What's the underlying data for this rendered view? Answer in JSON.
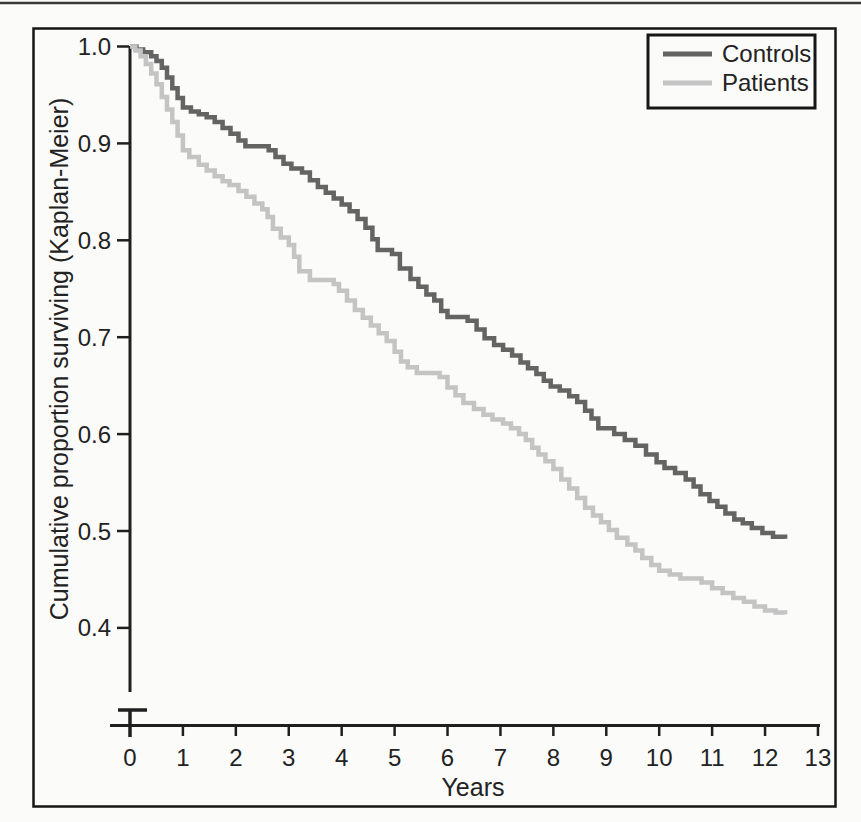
{
  "figure": {
    "y_axis_title": "Cumulative proportion surviving (Kaplan-Meier)",
    "x_axis_title": "Years"
  },
  "chart_data": {
    "type": "line",
    "variant": "kaplan-meier-step-curves",
    "title": "",
    "xlabel": "Years",
    "ylabel": "Cumulative proportion surviving (Kaplan-Meier)",
    "xlim": [
      0,
      13
    ],
    "ylim_displayed": [
      0.4,
      1.0
    ],
    "y_axis_break_at_bottom": true,
    "grid": false,
    "legend_position": "top-right",
    "x_ticks": [
      0,
      1,
      2,
      3,
      4,
      5,
      6,
      7,
      8,
      9,
      10,
      11,
      12,
      13
    ],
    "y_ticks": [
      1.0,
      0.9,
      0.8,
      0.7,
      0.6,
      0.5,
      0.4
    ],
    "y_tick_labels": [
      "1.0",
      "0.9",
      "0.8",
      "0.7",
      "0.6",
      "0.5",
      "0.4"
    ],
    "colors": {
      "controls": "#646464",
      "patients": "#c4c4c4",
      "axis": "#1f1f1f"
    },
    "series": [
      {
        "name": "Controls",
        "color": "#646464",
        "points": [
          [
            0,
            1.0
          ],
          [
            0.12,
            0.997
          ],
          [
            0.25,
            0.994
          ],
          [
            0.4,
            0.99
          ],
          [
            0.5,
            0.985
          ],
          [
            0.6,
            0.978
          ],
          [
            0.7,
            0.968
          ],
          [
            0.8,
            0.957
          ],
          [
            0.9,
            0.947
          ],
          [
            1.0,
            0.937
          ],
          [
            1.15,
            0.933
          ],
          [
            1.3,
            0.93
          ],
          [
            1.45,
            0.927
          ],
          [
            1.6,
            0.922
          ],
          [
            1.75,
            0.916
          ],
          [
            1.9,
            0.91
          ],
          [
            2.05,
            0.903
          ],
          [
            2.18,
            0.897
          ],
          [
            2.62,
            0.893
          ],
          [
            2.75,
            0.886
          ],
          [
            2.9,
            0.879
          ],
          [
            3.05,
            0.874
          ],
          [
            3.25,
            0.87
          ],
          [
            3.4,
            0.862
          ],
          [
            3.55,
            0.855
          ],
          [
            3.7,
            0.849
          ],
          [
            3.85,
            0.843
          ],
          [
            4.0,
            0.837
          ],
          [
            4.15,
            0.83
          ],
          [
            4.3,
            0.822
          ],
          [
            4.45,
            0.813
          ],
          [
            4.58,
            0.801
          ],
          [
            4.68,
            0.79
          ],
          [
            4.95,
            0.786
          ],
          [
            5.1,
            0.771
          ],
          [
            5.3,
            0.76
          ],
          [
            5.45,
            0.752
          ],
          [
            5.6,
            0.744
          ],
          [
            5.75,
            0.738
          ],
          [
            5.88,
            0.727
          ],
          [
            6.0,
            0.721
          ],
          [
            6.38,
            0.717
          ],
          [
            6.55,
            0.708
          ],
          [
            6.7,
            0.699
          ],
          [
            6.88,
            0.692
          ],
          [
            7.05,
            0.687
          ],
          [
            7.22,
            0.681
          ],
          [
            7.38,
            0.674
          ],
          [
            7.52,
            0.668
          ],
          [
            7.68,
            0.662
          ],
          [
            7.82,
            0.655
          ],
          [
            7.95,
            0.649
          ],
          [
            8.12,
            0.645
          ],
          [
            8.3,
            0.639
          ],
          [
            8.45,
            0.633
          ],
          [
            8.6,
            0.624
          ],
          [
            8.72,
            0.616
          ],
          [
            8.85,
            0.606
          ],
          [
            9.15,
            0.6
          ],
          [
            9.35,
            0.594
          ],
          [
            9.55,
            0.588
          ],
          [
            9.75,
            0.579
          ],
          [
            9.95,
            0.571
          ],
          [
            10.1,
            0.565
          ],
          [
            10.3,
            0.56
          ],
          [
            10.5,
            0.553
          ],
          [
            10.65,
            0.546
          ],
          [
            10.78,
            0.538
          ],
          [
            10.95,
            0.531
          ],
          [
            11.1,
            0.525
          ],
          [
            11.25,
            0.518
          ],
          [
            11.42,
            0.512
          ],
          [
            11.58,
            0.508
          ],
          [
            11.75,
            0.503
          ],
          [
            11.95,
            0.498
          ],
          [
            12.15,
            0.494
          ],
          [
            12.38,
            0.492
          ]
        ]
      },
      {
        "name": "Patients",
        "color": "#c4c4c4",
        "points": [
          [
            0,
            1.0
          ],
          [
            0.1,
            0.996
          ],
          [
            0.2,
            0.99
          ],
          [
            0.3,
            0.982
          ],
          [
            0.4,
            0.972
          ],
          [
            0.5,
            0.961
          ],
          [
            0.6,
            0.948
          ],
          [
            0.7,
            0.935
          ],
          [
            0.8,
            0.922
          ],
          [
            0.9,
            0.908
          ],
          [
            1.0,
            0.893
          ],
          [
            1.12,
            0.886
          ],
          [
            1.3,
            0.878
          ],
          [
            1.45,
            0.872
          ],
          [
            1.6,
            0.866
          ],
          [
            1.75,
            0.861
          ],
          [
            1.88,
            0.857
          ],
          [
            2.05,
            0.851
          ],
          [
            2.2,
            0.845
          ],
          [
            2.35,
            0.838
          ],
          [
            2.5,
            0.832
          ],
          [
            2.6,
            0.824
          ],
          [
            2.7,
            0.812
          ],
          [
            2.85,
            0.803
          ],
          [
            3.0,
            0.795
          ],
          [
            3.1,
            0.783
          ],
          [
            3.2,
            0.768
          ],
          [
            3.4,
            0.759
          ],
          [
            3.85,
            0.755
          ],
          [
            3.95,
            0.748
          ],
          [
            4.1,
            0.738
          ],
          [
            4.25,
            0.728
          ],
          [
            4.4,
            0.72
          ],
          [
            4.55,
            0.712
          ],
          [
            4.7,
            0.704
          ],
          [
            4.85,
            0.696
          ],
          [
            5.0,
            0.685
          ],
          [
            5.12,
            0.675
          ],
          [
            5.25,
            0.669
          ],
          [
            5.42,
            0.663
          ],
          [
            5.85,
            0.659
          ],
          [
            6.0,
            0.648
          ],
          [
            6.15,
            0.64
          ],
          [
            6.3,
            0.632
          ],
          [
            6.5,
            0.626
          ],
          [
            6.68,
            0.62
          ],
          [
            6.85,
            0.615
          ],
          [
            7.05,
            0.611
          ],
          [
            7.2,
            0.606
          ],
          [
            7.35,
            0.6
          ],
          [
            7.48,
            0.594
          ],
          [
            7.6,
            0.586
          ],
          [
            7.72,
            0.579
          ],
          [
            7.85,
            0.572
          ],
          [
            8.0,
            0.564
          ],
          [
            8.15,
            0.553
          ],
          [
            8.3,
            0.544
          ],
          [
            8.45,
            0.534
          ],
          [
            8.6,
            0.524
          ],
          [
            8.75,
            0.516
          ],
          [
            8.9,
            0.509
          ],
          [
            9.05,
            0.501
          ],
          [
            9.2,
            0.493
          ],
          [
            9.4,
            0.486
          ],
          [
            9.55,
            0.48
          ],
          [
            9.68,
            0.472
          ],
          [
            9.85,
            0.465
          ],
          [
            10.0,
            0.459
          ],
          [
            10.2,
            0.455
          ],
          [
            10.4,
            0.451
          ],
          [
            10.8,
            0.447
          ],
          [
            11.0,
            0.441
          ],
          [
            11.2,
            0.436
          ],
          [
            11.4,
            0.431
          ],
          [
            11.6,
            0.427
          ],
          [
            11.8,
            0.422
          ],
          [
            12.0,
            0.418
          ],
          [
            12.2,
            0.416
          ],
          [
            12.38,
            0.414
          ]
        ]
      }
    ]
  }
}
